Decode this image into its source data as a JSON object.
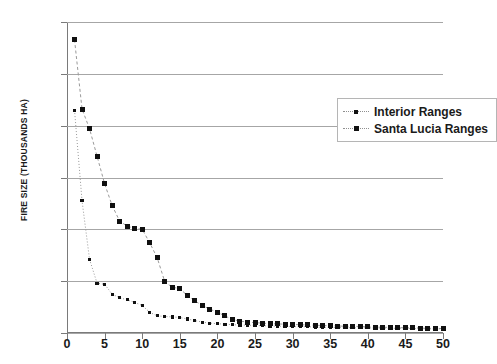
{
  "chart_data": {
    "type": "scatter",
    "title": "",
    "xlabel": "",
    "ylabel": "FIRE SIZE (THOUSANDS HA)",
    "xlim": [
      0,
      50
    ],
    "ylim": [
      0,
      60
    ],
    "xticks": [
      0,
      5,
      10,
      15,
      20,
      25,
      30,
      35,
      40,
      45,
      50
    ],
    "yticks": [
      0,
      10,
      20,
      30,
      40,
      50,
      60
    ],
    "grid": "horizontal",
    "legend_position": "upper-right-inside",
    "series": [
      {
        "name": "Interior Ranges",
        "marker": "small-dot",
        "line": "dotted",
        "color": "#101010",
        "x": [
          1,
          2,
          3,
          4,
          5,
          6,
          7,
          8,
          9,
          10,
          11,
          12,
          13,
          14,
          15,
          16,
          17,
          18,
          19,
          20,
          21,
          22,
          23,
          24,
          25,
          26,
          27,
          28,
          29,
          30,
          31,
          32,
          33,
          34,
          35,
          36,
          37,
          38,
          39,
          40,
          41,
          42,
          43,
          44,
          45,
          46,
          47,
          48,
          49,
          50
        ],
        "y": [
          43.0,
          25.5,
          14.2,
          9.6,
          9.4,
          7.5,
          6.8,
          6.4,
          5.9,
          5.3,
          4.0,
          3.3,
          3.2,
          3.1,
          3.0,
          2.7,
          2.4,
          2.1,
          1.9,
          1.8,
          1.7,
          1.6,
          1.55,
          1.5,
          1.45,
          1.4,
          1.35,
          1.3,
          1.3,
          1.25,
          1.2,
          1.2,
          1.15,
          1.1,
          1.1,
          1.05,
          1.05,
          1.0,
          1.0,
          1.0,
          0.95,
          0.95,
          0.9,
          0.9,
          0.9,
          0.85,
          0.85,
          0.8,
          0.8,
          0.8
        ]
      },
      {
        "name": "Santa Lucia Ranges",
        "marker": "square",
        "line": "dashed",
        "color": "#101010",
        "x": [
          1,
          2,
          3,
          4,
          5,
          6,
          7,
          8,
          9,
          10,
          11,
          12,
          13,
          14,
          15,
          16,
          17,
          18,
          19,
          20,
          21,
          22,
          23,
          24,
          25,
          26,
          27,
          28,
          29,
          30,
          31,
          32,
          33,
          34,
          35,
          36,
          37,
          38,
          39,
          40,
          41,
          42,
          43,
          44,
          45,
          46,
          47,
          48,
          49,
          50
        ],
        "y": [
          56.6,
          43.2,
          39.4,
          34.1,
          28.8,
          24.6,
          21.6,
          20.6,
          20.2,
          20.0,
          17.4,
          14.5,
          9.9,
          8.8,
          8.6,
          7.2,
          6.2,
          5.3,
          4.6,
          4.0,
          3.3,
          2.6,
          2.3,
          2.1,
          2.0,
          1.9,
          1.8,
          1.75,
          1.7,
          1.65,
          1.6,
          1.55,
          1.5,
          1.45,
          1.4,
          1.35,
          1.3,
          1.3,
          1.25,
          1.2,
          1.15,
          1.1,
          1.1,
          1.05,
          1.0,
          1.0,
          0.95,
          0.9,
          0.9,
          0.85
        ]
      }
    ]
  },
  "legend": {
    "items": [
      {
        "label": "Interior Ranges"
      },
      {
        "label": "Santa Lucia Ranges"
      }
    ]
  },
  "axes": {
    "y_title": "FIRE SIZE (THOUSANDS HA)"
  }
}
